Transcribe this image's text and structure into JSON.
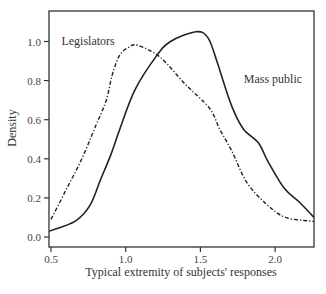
{
  "chart_data": {
    "type": "line",
    "title": "",
    "xlabel": "Typical extremity of subjects' responses",
    "ylabel": "Density",
    "xlim": [
      0.49,
      2.27
    ],
    "ylim": [
      -0.05,
      1.13
    ],
    "xticks": [
      0.5,
      1.0,
      1.5,
      2.0
    ],
    "xtick_labels": [
      "0.5",
      "1.0",
      "1.5",
      "2.0"
    ],
    "yticks": [
      0.0,
      0.2,
      0.4,
      0.6,
      0.8,
      1.0
    ],
    "ytick_labels": [
      "0.0",
      "0.2",
      "0.4",
      "0.6",
      "0.8",
      "1.0"
    ],
    "grid": false,
    "legend": "none (inline annotations)",
    "series": [
      {
        "name": "Mass public",
        "style": "solid",
        "x": [
          0.49,
          0.66,
          0.76,
          0.83,
          0.9,
          0.96,
          1.06,
          1.2,
          1.3,
          1.47,
          1.55,
          1.61,
          1.66,
          1.72,
          1.79,
          1.89,
          1.95,
          2.06,
          2.16,
          2.26
        ],
        "y": [
          0.03,
          0.08,
          0.16,
          0.29,
          0.42,
          0.55,
          0.75,
          0.92,
          1.0,
          1.05,
          1.02,
          0.9,
          0.78,
          0.65,
          0.55,
          0.48,
          0.39,
          0.25,
          0.18,
          0.1
        ]
      },
      {
        "name": "Legislators",
        "style": "dash-dot",
        "x": [
          0.5,
          0.6,
          0.7,
          0.8,
          0.87,
          0.91,
          0.96,
          1.02,
          1.08,
          1.23,
          1.4,
          1.56,
          1.63,
          1.71,
          1.81,
          1.94,
          2.07,
          2.26
        ],
        "y": [
          0.09,
          0.24,
          0.39,
          0.57,
          0.7,
          0.83,
          0.93,
          0.97,
          0.98,
          0.92,
          0.78,
          0.66,
          0.55,
          0.44,
          0.28,
          0.17,
          0.1,
          0.08
        ]
      }
    ],
    "annotations": [
      {
        "text": "Legislators",
        "x": 0.57,
        "y": 0.98
      },
      {
        "text": "Mass public",
        "x": 1.79,
        "y": 0.79
      }
    ]
  }
}
